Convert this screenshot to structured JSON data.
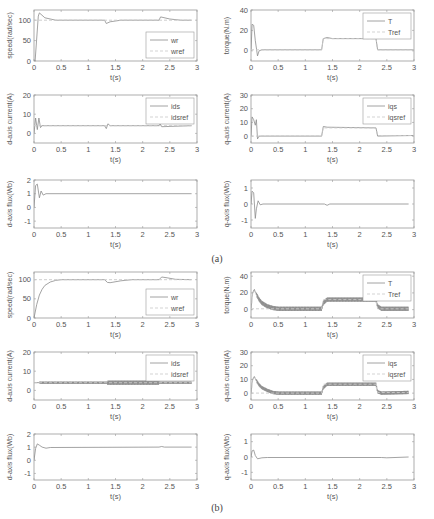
{
  "captions": {
    "a": "(a)",
    "b": "(b)"
  },
  "colors": {
    "axis": "#9a9a9a",
    "line": "#8c8c8c",
    "ref": "#c8c8c8",
    "noisy": "#777777"
  },
  "chart_data": [
    {
      "id": "a-speed",
      "group": "a",
      "type": "line",
      "xlabel": "t(s)",
      "ylabel": "speed(rad/sec)",
      "xlim": [
        0,
        3
      ],
      "ylim": [
        0,
        125
      ],
      "xticks": [
        0,
        0.5,
        1,
        1.5,
        2,
        2.5,
        3
      ],
      "yticks": [
        0,
        50,
        100
      ],
      "legend": [
        "wr",
        "wref"
      ],
      "legend_position": "lower right",
      "series": [
        {
          "name": "wr",
          "x": [
            0,
            0.02,
            0.08,
            0.1,
            0.2,
            0.4,
            1.3,
            1.33,
            1.4,
            1.6,
            2.3,
            2.33,
            2.5,
            2.7,
            2.9
          ],
          "y": [
            0,
            0,
            110,
            118,
            106,
            100,
            100,
            92,
            96,
            100,
            100,
            108,
            103,
            100,
            100
          ]
        },
        {
          "name": "wref",
          "x": [
            0,
            2.9
          ],
          "y": [
            100,
            100
          ],
          "dashed": true
        }
      ]
    },
    {
      "id": "a-torque",
      "group": "a",
      "type": "line",
      "xlabel": "t(s)",
      "ylabel": "torque(N.m)",
      "xlim": [
        0,
        3
      ],
      "ylim": [
        -10,
        40
      ],
      "xticks": [
        0,
        0.5,
        1,
        1.5,
        2,
        2.5,
        3
      ],
      "yticks": [
        0,
        20,
        40
      ],
      "legend": [
        "T",
        "Tref"
      ],
      "legend_position": "upper right",
      "series": [
        {
          "name": "T",
          "x": [
            0,
            0.02,
            0.05,
            0.08,
            0.12,
            0.15,
            0.2,
            1.3,
            1.33,
            1.4,
            1.5,
            2.3,
            2.33,
            3.0
          ],
          "y": [
            0,
            26,
            25,
            10,
            -5,
            0,
            1,
            1,
            12,
            13,
            12,
            12,
            1,
            1
          ]
        },
        {
          "name": "Tref",
          "x": [
            0,
            1.3,
            1.33,
            2.3,
            2.33,
            3.0
          ],
          "y": [
            1,
            1,
            12,
            12,
            1,
            1
          ],
          "dashed": true
        }
      ]
    },
    {
      "id": "a-ids",
      "group": "a",
      "type": "line",
      "xlabel": "t(s)",
      "ylabel": "d-axis current(A)",
      "xlim": [
        0,
        3
      ],
      "ylim": [
        -5,
        20
      ],
      "xticks": [
        0,
        0.5,
        1,
        1.5,
        2,
        2.5,
        3
      ],
      "yticks": [
        0,
        10,
        20
      ],
      "legend": [
        "ids",
        "idsref"
      ],
      "legend_position": "upper right",
      "series": [
        {
          "name": "ids",
          "x": [
            0,
            0.03,
            0.06,
            0.09,
            0.12,
            0.15,
            0.2,
            1.3,
            1.33,
            1.36,
            1.4,
            2.3,
            2.32,
            2.35,
            2.9
          ],
          "y": [
            0,
            8,
            2,
            8,
            3,
            4,
            4,
            4,
            2.5,
            5,
            4,
            4,
            5,
            3.5,
            4
          ]
        },
        {
          "name": "idsref",
          "x": [
            0,
            2.9
          ],
          "y": [
            4,
            4
          ],
          "dashed": true
        }
      ]
    },
    {
      "id": "a-iqs",
      "group": "a",
      "type": "line",
      "xlabel": "t(s)",
      "ylabel": "q-axis current(A)",
      "xlim": [
        0,
        3
      ],
      "ylim": [
        -5,
        30
      ],
      "xticks": [
        0,
        0.5,
        1,
        1.5,
        2,
        2.5,
        3
      ],
      "yticks": [
        0,
        10,
        20,
        30
      ],
      "legend": [
        "iqs",
        "iqsref"
      ],
      "legend_position": "upper right",
      "series": [
        {
          "name": "iqs",
          "x": [
            0,
            0.02,
            0.05,
            0.08,
            0.1,
            0.12,
            0.15,
            0.2,
            1.3,
            1.33,
            1.4,
            2.3,
            2.33,
            3.0
          ],
          "y": [
            0,
            14,
            12,
            8,
            12,
            -2,
            0,
            0,
            0,
            7,
            6.5,
            6,
            0,
            0.5
          ]
        },
        {
          "name": "iqsref",
          "x": [
            0,
            1.3,
            1.33,
            2.3,
            2.33,
            3.0
          ],
          "y": [
            0,
            0,
            6,
            6,
            0.5,
            0.5
          ],
          "dashed": true
        }
      ]
    },
    {
      "id": "a-dflux",
      "group": "a",
      "type": "line",
      "xlabel": "t(s)",
      "ylabel": "d-axis flux(Wb)",
      "xlim": [
        0,
        3
      ],
      "ylim": [
        -1.5,
        2
      ],
      "xticks": [
        0,
        0.5,
        1,
        1.5,
        2,
        2.5,
        3
      ],
      "yticks": [
        -1,
        0,
        1,
        2
      ],
      "legend": [],
      "series": [
        {
          "name": "lambda_ds",
          "x": [
            0,
            0.03,
            0.06,
            0.1,
            0.13,
            0.17,
            0.22,
            2.9
          ],
          "y": [
            0,
            1.6,
            1.7,
            0.7,
            1.2,
            0.9,
            1.0,
            1.0
          ]
        }
      ]
    },
    {
      "id": "a-qflux",
      "group": "a",
      "type": "line",
      "xlabel": "t(s)",
      "ylabel": "q-axis flux(Wb)",
      "xlim": [
        0,
        3
      ],
      "ylim": [
        -1.5,
        1.5
      ],
      "xticks": [
        0,
        0.5,
        1,
        1.5,
        2,
        2.5,
        3
      ],
      "yticks": [
        -1,
        0,
        1
      ],
      "legend": [],
      "series": [
        {
          "name": "lambda_qs",
          "x": [
            0,
            0.02,
            0.05,
            0.08,
            0.1,
            0.13,
            0.17,
            0.22,
            1.35,
            1.4,
            1.45,
            2.9
          ],
          "y": [
            0,
            0.8,
            0.7,
            -0.9,
            -0.3,
            0.2,
            -0.05,
            0,
            0,
            -0.08,
            0,
            0
          ]
        }
      ]
    },
    {
      "id": "b-speed",
      "group": "b",
      "type": "line",
      "xlabel": "t(s)",
      "ylabel": "speed(rad/sec)",
      "xlim": [
        0,
        3
      ],
      "ylim": [
        0,
        120
      ],
      "xticks": [
        0,
        0.5,
        1,
        1.5,
        2,
        2.5,
        3
      ],
      "yticks": [
        0,
        50,
        100
      ],
      "legend": [
        "wr",
        "wref"
      ],
      "legend_position": "lower right",
      "series": [
        {
          "name": "wr",
          "x": [
            0,
            0.05,
            0.1,
            0.15,
            0.2,
            0.3,
            0.4,
            0.5,
            1.3,
            1.35,
            1.4,
            1.6,
            1.8,
            2.3,
            2.35,
            2.45,
            2.6,
            2.9
          ],
          "y": [
            0,
            35,
            60,
            75,
            85,
            94,
            98,
            100,
            100,
            93,
            92,
            97,
            100,
            100,
            107,
            105,
            101,
            100
          ]
        },
        {
          "name": "wref",
          "x": [
            0,
            2.9
          ],
          "y": [
            100,
            100
          ],
          "dashed": true
        }
      ]
    },
    {
      "id": "b-torque",
      "group": "b",
      "type": "line",
      "xlabel": "t(s)",
      "ylabel": "torque(N.m)",
      "xlim": [
        0,
        3
      ],
      "ylim": [
        -10,
        45
      ],
      "xticks": [
        0,
        0.5,
        1,
        1.5,
        2,
        2.5,
        3
      ],
      "yticks": [
        0,
        20,
        40
      ],
      "legend": [
        "T",
        "Tref"
      ],
      "legend_position": "upper right",
      "noise_band": 2.5,
      "series": [
        {
          "name": "T",
          "x": [
            0,
            0.03,
            0.06,
            0.1,
            0.15,
            0.2,
            0.3,
            0.4,
            0.5,
            1.3,
            1.33,
            1.4,
            1.5,
            2.3,
            2.33,
            2.4,
            2.9
          ],
          "y": [
            0,
            20,
            24,
            18,
            12,
            8,
            4,
            2,
            1,
            1,
            8,
            12,
            12,
            12,
            4,
            1,
            1
          ],
          "noisy": true
        },
        {
          "name": "Tref",
          "x": [
            0,
            1.3,
            1.33,
            2.3,
            2.33,
            2.9
          ],
          "y": [
            1,
            1,
            12,
            12,
            1,
            1
          ],
          "dashed": true
        }
      ]
    },
    {
      "id": "b-ids",
      "group": "b",
      "type": "line",
      "xlabel": "t(s)",
      "ylabel": "d-axis current(A)",
      "xlim": [
        0,
        3
      ],
      "ylim": [
        -5,
        20
      ],
      "xticks": [
        0,
        0.5,
        1,
        1.5,
        2,
        2.5,
        3
      ],
      "yticks": [
        0,
        10,
        20
      ],
      "legend": [
        "ids",
        "idsref"
      ],
      "legend_position": "upper right",
      "noise_band": 0.6,
      "series": [
        {
          "name": "ids",
          "x": [
            0,
            1.3,
            1.4,
            2.3,
            2.4,
            2.9
          ],
          "y": [
            4,
            4,
            4,
            4,
            4,
            4
          ],
          "noisy": true
        },
        {
          "name": "idsref",
          "x": [
            0,
            2.9
          ],
          "y": [
            4,
            4
          ],
          "dashed": true
        }
      ]
    },
    {
      "id": "b-iqs",
      "group": "b",
      "type": "line",
      "xlabel": "t(s)",
      "ylabel": "q-axis current(A)",
      "xlim": [
        0,
        3
      ],
      "ylim": [
        -5,
        30
      ],
      "xticks": [
        0,
        0.5,
        1,
        1.5,
        2,
        2.5,
        3
      ],
      "yticks": [
        0,
        10,
        20,
        30
      ],
      "legend": [
        "iqs",
        "iqsref"
      ],
      "legend_position": "upper right",
      "noise_band": 1.2,
      "series": [
        {
          "name": "iqs",
          "x": [
            0,
            0.03,
            0.06,
            0.1,
            0.15,
            0.2,
            0.3,
            0.4,
            0.5,
            1.3,
            1.33,
            1.4,
            1.5,
            2.3,
            2.33,
            2.4,
            2.9
          ],
          "y": [
            0,
            10,
            12,
            9,
            6,
            4,
            2,
            0.5,
            0,
            0,
            4,
            6.5,
            6.5,
            6.5,
            1,
            0,
            0.5
          ],
          "noisy": true
        },
        {
          "name": "iqsref",
          "x": [
            0,
            1.3,
            1.33,
            2.3,
            2.33,
            2.9
          ],
          "y": [
            0,
            0,
            6.5,
            6.5,
            0.5,
            0.5
          ],
          "dashed": true
        }
      ]
    },
    {
      "id": "b-dflux",
      "group": "b",
      "type": "line",
      "xlabel": "t(s)",
      "ylabel": "d-axis flux(Wb)",
      "xlim": [
        0,
        3
      ],
      "ylim": [
        -1.5,
        2
      ],
      "xticks": [
        0,
        0.5,
        1,
        1.5,
        2,
        2.5,
        3
      ],
      "yticks": [
        -1,
        0,
        1,
        2
      ],
      "legend": [],
      "series": [
        {
          "name": "lambda_ds",
          "x": [
            0,
            0.03,
            0.06,
            0.1,
            0.15,
            0.22,
            0.3,
            2.3,
            2.35,
            2.4,
            2.9
          ],
          "y": [
            0,
            0.9,
            1.25,
            1.15,
            1.0,
            0.92,
            0.97,
            1.0,
            1.05,
            1.0,
            1.0
          ]
        }
      ]
    },
    {
      "id": "b-qflux",
      "group": "b",
      "type": "line",
      "xlabel": "t(s)",
      "ylabel": "q-axis flux(Wb)",
      "xlim": [
        0,
        3
      ],
      "ylim": [
        -1.5,
        1.5
      ],
      "xticks": [
        0,
        0.5,
        1,
        1.5,
        2,
        2.5,
        3
      ],
      "yticks": [
        -1,
        0,
        1
      ],
      "legend": [],
      "series": [
        {
          "name": "lambda_qs",
          "x": [
            0,
            0.02,
            0.05,
            0.08,
            0.12,
            0.2,
            0.3,
            2.4,
            2.5,
            2.9
          ],
          "y": [
            0,
            0.4,
            0.45,
            0.1,
            -0.12,
            -0.05,
            -0.03,
            -0.03,
            -0.05,
            0
          ]
        }
      ]
    }
  ]
}
